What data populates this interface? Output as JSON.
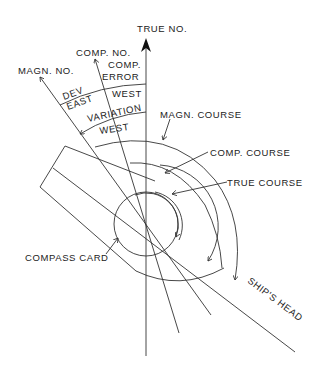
{
  "diagram": {
    "type": "compass-error-diagram",
    "labels": {
      "true_north": "TRUE NO.",
      "comp_north": "COMP. NO.",
      "magn_north": "MAGN. NO.",
      "comp_error_1": "COMP.",
      "comp_error_2": "ERROR",
      "dev": "DEV",
      "dev_east": "EAST",
      "error_west": "WEST",
      "variation": "VARIATION",
      "variation_west": "WEST",
      "magn_course": "MAGN. COURSE",
      "comp_course": "COMP. COURSE",
      "true_course": "TRUE COURSE",
      "compass_card": "COMPASS CARD",
      "ships_head": "SHIP'S HEAD"
    },
    "line_color": "#333333",
    "background": "#ffffff"
  }
}
